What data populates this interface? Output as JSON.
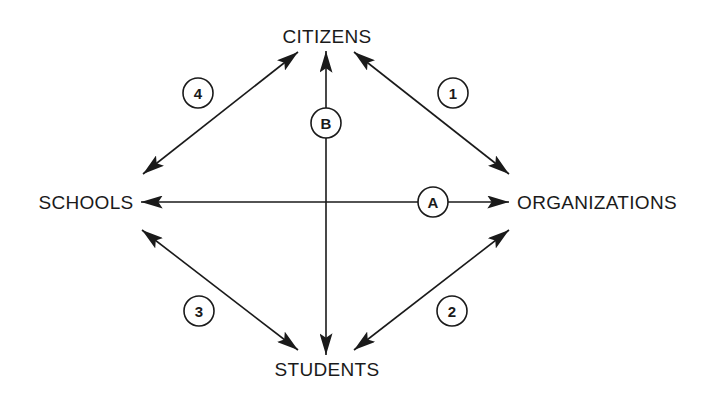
{
  "nodes": {
    "top": "CITIZENS",
    "left": "SCHOOLS",
    "right": "ORGANIZATIONS",
    "bottom": "STUDENTS"
  },
  "edges": [
    {
      "id": "1",
      "from": "CITIZENS",
      "to": "ORGANIZATIONS",
      "direction": "bidirectional"
    },
    {
      "id": "2",
      "from": "ORGANIZATIONS",
      "to": "STUDENTS",
      "direction": "bidirectional"
    },
    {
      "id": "3",
      "from": "SCHOOLS",
      "to": "STUDENTS",
      "direction": "bidirectional"
    },
    {
      "id": "4",
      "from": "SCHOOLS",
      "to": "CITIZENS",
      "direction": "bidirectional"
    },
    {
      "id": "A",
      "from": "SCHOOLS",
      "to": "ORGANIZATIONS",
      "direction": "bidirectional"
    },
    {
      "id": "B",
      "from": "STUDENTS",
      "to": "CITIZENS",
      "direction": "bidirectional"
    }
  ],
  "markers": {
    "m1": "1",
    "m2": "2",
    "m3": "3",
    "m4": "4",
    "mA": "A",
    "mB": "B"
  },
  "colors": {
    "ink": "#1a1a1a",
    "background": "#ffffff"
  }
}
